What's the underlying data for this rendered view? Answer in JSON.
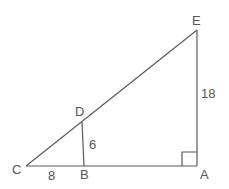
{
  "diagram": {
    "type": "similar-right-triangles",
    "points": {
      "C": {
        "label": "C",
        "x": 26,
        "y": 166
      },
      "B": {
        "label": "B",
        "x": 84,
        "y": 166
      },
      "A": {
        "label": "A",
        "x": 197,
        "y": 166
      },
      "E": {
        "label": "E",
        "x": 197,
        "y": 30
      },
      "D": {
        "label": "D",
        "x": 82,
        "y": 122
      }
    },
    "segments": [
      {
        "from": "C",
        "to": "A"
      },
      {
        "from": "A",
        "to": "E"
      },
      {
        "from": "C",
        "to": "E"
      },
      {
        "from": "D",
        "to": "B"
      }
    ],
    "measurements": {
      "CB": "8",
      "DB": "6",
      "EA": "18"
    },
    "right_angle_at": "A"
  }
}
